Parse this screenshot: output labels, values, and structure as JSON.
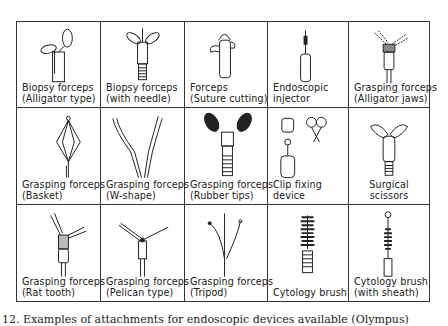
{
  "figure": {
    "caption": "12. Examples of attachments for endoscopic devices available (Olympus)",
    "rows": [
      [
        {
          "line1": "Biopsy forceps",
          "line2": "(Alligator type)",
          "icon": "biopsy-forceps-alligator-icon"
        },
        {
          "line1": "Biopsy forceps",
          "line2": "(with needle)",
          "icon": "biopsy-forceps-needle-icon"
        },
        {
          "line1": "Forceps",
          "line2": "(Suture cutting)",
          "icon": "suture-cutting-forceps-icon"
        },
        {
          "line1": "Endoscopic",
          "line2": "injector",
          "icon": "endoscopic-injector-icon"
        },
        {
          "line1": "Grasping forceps",
          "line2": "(Alligator jaws)",
          "icon": "grasping-forceps-alligator-jaws-icon"
        }
      ],
      [
        {
          "line1": "Grasping forceps",
          "line2": "(Basket)",
          "icon": "basket-forceps-icon"
        },
        {
          "line1": "Grasping forceps",
          "line2": "(W-shape)",
          "icon": "w-shape-forceps-icon"
        },
        {
          "line1": "Grasping forceps",
          "line2": "(Rubber tips)",
          "icon": "rubber-tip-forceps-icon"
        },
        {
          "line1": "Clip fixing",
          "line2": "device",
          "icon": "clip-fixing-device-icon"
        },
        {
          "line1": "Surgical",
          "line2": "scissors",
          "icon": "surgical-scissors-icon"
        }
      ],
      [
        {
          "line1": "Grasping forceps",
          "line2": "(Rat tooth)",
          "icon": "rat-tooth-forceps-icon"
        },
        {
          "line1": "Grasping forceps",
          "line2": "(Pelican type)",
          "icon": "pelican-forceps-icon"
        },
        {
          "line1": "Grasping forceps",
          "line2": "(Tripod)",
          "icon": "tripod-forceps-icon"
        },
        {
          "line1": "Cytology brush",
          "line2": "",
          "icon": "cytology-brush-icon"
        },
        {
          "line1": "Cytology brush",
          "line2": "(with sheath)",
          "icon": "cytology-brush-sheath-icon"
        }
      ]
    ]
  }
}
